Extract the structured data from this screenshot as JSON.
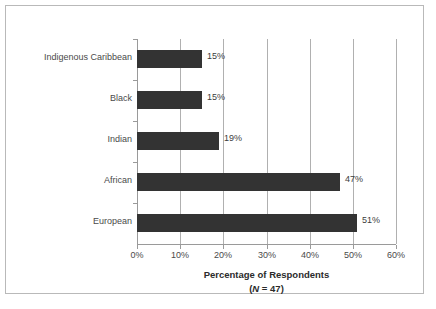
{
  "chart_data": {
    "type": "bar",
    "orientation": "horizontal",
    "title": "",
    "xlabel": "Percentage of Respondents",
    "xlabel_note_prefix": "(",
    "xlabel_note_italic": "N",
    "xlabel_note_suffix": " = 47)",
    "ylabel": "",
    "categories": [
      "European",
      "African",
      "Indian",
      "Black",
      "Indigenous Caribbean"
    ],
    "values": [
      51,
      47,
      19,
      15,
      15
    ],
    "value_labels": [
      "51%",
      "47%",
      "19%",
      "15%",
      "15%"
    ],
    "xlim": [
      0,
      60
    ],
    "xticks": [
      0,
      10,
      20,
      30,
      40,
      50,
      60
    ],
    "xtick_labels": [
      "0%",
      "10%",
      "20%",
      "30%",
      "40%",
      "50%",
      "60%"
    ],
    "grid": "vertical",
    "legend": "none",
    "bar_color": "#333333",
    "gridline_color": "#b0b0b0",
    "axis_color": "#9a9a9a",
    "text_color": "#4a4a4a",
    "border_color": "#b9b9b9",
    "background": "#ffffff"
  }
}
